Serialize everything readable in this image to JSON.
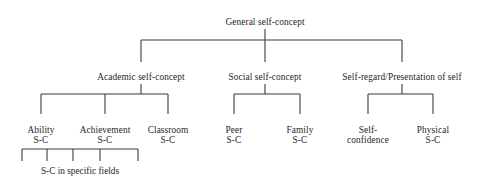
{
  "diagram": {
    "type": "hierarchy-tree",
    "line_color": "#3b3b3b",
    "text_color": "#262626",
    "background": "#ffffff",
    "levels": [
      {
        "level": 1,
        "nodes": [
          {
            "id": "general",
            "label": "General self-concept",
            "x": 265,
            "y": 17
          }
        ]
      },
      {
        "level": 2,
        "nodes": [
          {
            "id": "academic",
            "label": "Academic self-concept",
            "x": 141,
            "y": 72
          },
          {
            "id": "social",
            "label": "Social self-concept",
            "x": 265,
            "y": 72
          },
          {
            "id": "selfregard",
            "label": "Self-regard/Presentation of self",
            "x": 402,
            "y": 72
          }
        ]
      },
      {
        "level": 3,
        "nodes": [
          {
            "id": "ability",
            "line1": "Ability",
            "line2": "S-C",
            "x": 41,
            "y": 125
          },
          {
            "id": "achievement",
            "line1": "Achievement",
            "line2": "S-C",
            "x": 105,
            "y": 125
          },
          {
            "id": "classroom",
            "line1": "Classroom",
            "line2": "S-C",
            "x": 168,
            "y": 125
          },
          {
            "id": "peer",
            "line1": "Peer",
            "line2": "S-C",
            "x": 234,
            "y": 125
          },
          {
            "id": "family",
            "line1": "Family",
            "line2": "S-C",
            "x": 300,
            "y": 125
          },
          {
            "id": "selfconfidence",
            "line1": "Self-",
            "line2": "confidence",
            "x": 368,
            "y": 125
          },
          {
            "id": "physical",
            "line1": "Physical",
            "line2": "S-C",
            "x": 433,
            "y": 125
          }
        ]
      }
    ],
    "bottom_bracket": {
      "caption": "S-C in specific fields",
      "caption_x": 80,
      "caption_y": 166,
      "left": 22,
      "right": 138,
      "ticks": [
        22,
        47,
        73,
        100,
        138
      ],
      "tick_count": 5
    },
    "connectors": {
      "root_stem": {
        "x": 265,
        "y1": 29,
        "y2": 40
      },
      "top_bar": {
        "y": 40,
        "x1": 141,
        "x2": 402
      },
      "top_drops": [
        {
          "x": 141,
          "y1": 40,
          "y2": 62
        },
        {
          "x": 265,
          "y1": 40,
          "y2": 62
        },
        {
          "x": 402,
          "y1": 40,
          "y2": 62
        }
      ],
      "branch_stems": [
        {
          "x": 141,
          "y1": 84,
          "y2": 94
        },
        {
          "x": 265,
          "y1": 84,
          "y2": 94
        },
        {
          "x": 402,
          "y1": 84,
          "y2": 94
        }
      ],
      "branch_bars": [
        {
          "y": 94,
          "x1": 41,
          "x2": 168
        },
        {
          "y": 94,
          "x1": 234,
          "x2": 300
        },
        {
          "y": 94,
          "x1": 368,
          "x2": 433
        }
      ],
      "leaf_drops": [
        {
          "x": 41,
          "y1": 94,
          "y2": 114
        },
        {
          "x": 105,
          "y1": 94,
          "y2": 114
        },
        {
          "x": 168,
          "y1": 94,
          "y2": 114
        },
        {
          "x": 234,
          "y1": 94,
          "y2": 114
        },
        {
          "x": 300,
          "y1": 94,
          "y2": 114
        },
        {
          "x": 368,
          "y1": 94,
          "y2": 114
        },
        {
          "x": 433,
          "y1": 94,
          "y2": 114
        }
      ],
      "bottom_bar": {
        "y": 149,
        "x1": 22,
        "x2": 138
      },
      "bottom_ticks": [
        {
          "x": 22,
          "y1": 149,
          "y2": 161
        },
        {
          "x": 47,
          "y1": 149,
          "y2": 161
        },
        {
          "x": 73,
          "y1": 149,
          "y2": 161
        },
        {
          "x": 100,
          "y1": 149,
          "y2": 161
        },
        {
          "x": 138,
          "y1": 149,
          "y2": 161
        }
      ]
    }
  }
}
